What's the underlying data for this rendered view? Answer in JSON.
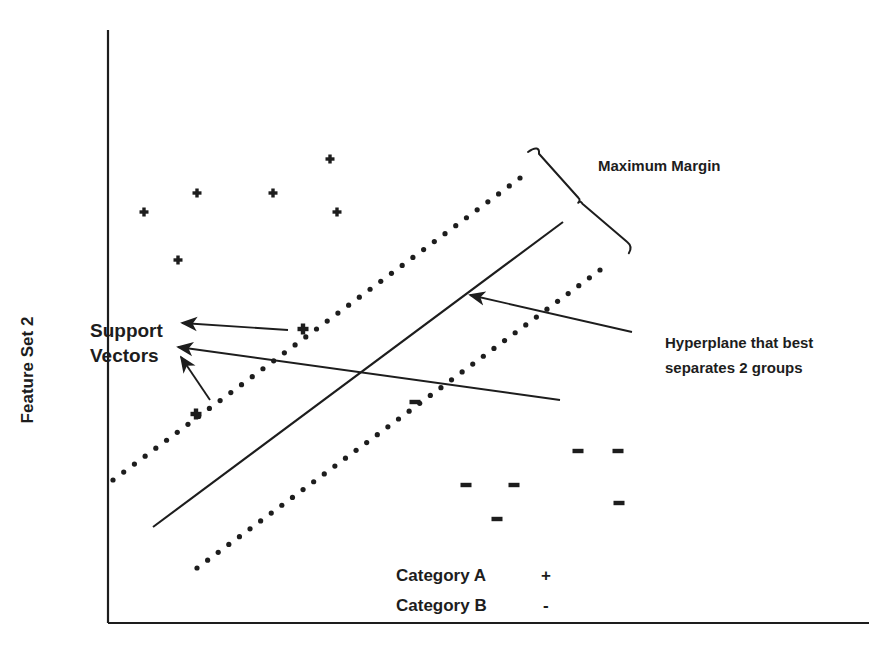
{
  "figure": {
    "kind": "svm-maximum-margin-diagram",
    "background_color": "#ffffff",
    "ink_color": "#1d1d1d"
  },
  "axes": {
    "y_label": "Feature Set 2",
    "x_label": "",
    "y_axis": {
      "x": 108,
      "y_top": 30,
      "y_bottom": 623
    },
    "x_axis": {
      "y": 623,
      "x_left": 108,
      "x_right": 869
    }
  },
  "annotations": {
    "maximum_margin": "Maximum Margin",
    "hyperplane_line1": "Hyperplane that best",
    "hyperplane_line2": "separates 2 groups",
    "support_vectors_line1": "Support",
    "support_vectors_line2": "Vectors"
  },
  "legend": {
    "items": [
      {
        "label": "Category A",
        "glyph": "+"
      },
      {
        "label": "Category B",
        "glyph": "-"
      }
    ]
  },
  "chart_data": {
    "type": "scatter",
    "title": "",
    "xlabel": "",
    "ylabel": "Feature Set 2",
    "grid": false,
    "legend_position": "bottom-center",
    "series": [
      {
        "name": "Category A",
        "glyph": "+",
        "points": [
          [
            144,
            212
          ],
          [
            197,
            193
          ],
          [
            273,
            193
          ],
          [
            330,
            159
          ],
          [
            337,
            212
          ],
          [
            178,
            260
          ],
          [
            303,
            329
          ],
          [
            196,
            414
          ]
        ],
        "support_vector_indices": [
          6,
          7
        ]
      },
      {
        "name": "Category B",
        "glyph": "-",
        "points": [
          [
            415,
            402
          ],
          [
            578,
            451
          ],
          [
            618,
            451
          ],
          [
            466,
            485
          ],
          [
            514,
            485
          ],
          [
            619,
            503
          ],
          [
            497,
            519
          ]
        ],
        "support_vector_indices": [
          0
        ]
      }
    ],
    "decision_boundary": {
      "name": "hyperplane",
      "style": "solid",
      "x1": 153,
      "y1": 527,
      "x2": 563,
      "y2": 222
    },
    "margins": [
      {
        "name": "upper-margin",
        "style": "dotted",
        "x1": 113,
        "y1": 480,
        "x2": 520,
        "y2": 178
      },
      {
        "name": "lower-margin",
        "style": "dotted",
        "x1": 197,
        "y1": 568,
        "x2": 600,
        "y2": 270
      }
    ],
    "brace": {
      "name": "maximum-margin-brace",
      "x1": 528,
      "y1": 152,
      "x2": 629,
      "y2": 253
    },
    "arrows": [
      {
        "name": "support-vector-arrow-upper",
        "from": [
          288,
          330
        ],
        "to": [
          182,
          323
        ]
      },
      {
        "name": "support-vector-arrow-middle",
        "from": [
          560,
          400
        ],
        "to": [
          178,
          347
        ]
      },
      {
        "name": "support-vector-arrow-lower",
        "from": [
          210,
          400
        ],
        "to": [
          181,
          357
        ]
      },
      {
        "name": "hyperplane-arrow",
        "from": [
          632,
          332
        ],
        "to": [
          470,
          295
        ]
      }
    ]
  }
}
